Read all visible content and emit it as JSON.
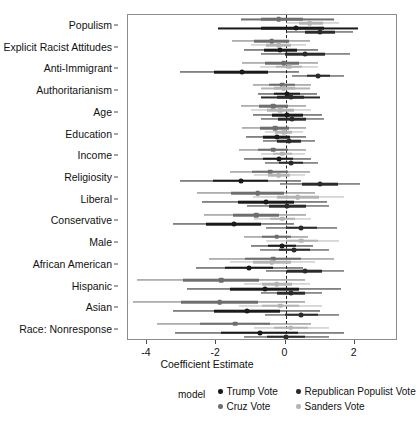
{
  "chart_data": {
    "type": "scatter",
    "title": "",
    "xlabel": "Coefficient Estimate",
    "ylabel": "",
    "xlim": [
      -4.55,
      3.25
    ],
    "xticks": [
      -4,
      -2,
      0,
      2
    ],
    "xticklabels": [
      "-4",
      "-2",
      "0",
      "2"
    ],
    "grid": false,
    "reference_line": 0,
    "legend_position": "bottom",
    "legend_title": "model",
    "categories": [
      "Populism",
      "Explicit Racist Attitudes",
      "Anti-Immigrant",
      "Authoritarianism",
      "Age",
      "Education",
      "Income",
      "Religiosity",
      "Liberal",
      "Conservative",
      "Male",
      "African American",
      "Hispanic",
      "Asian",
      "Race: Nonresponse"
    ],
    "series": [
      {
        "name": "Trump Vote",
        "color": "#1a1a1a",
        "marker": "circle",
        "estimates": [
          0.3,
          -0.15,
          -1.25,
          0.05,
          0.05,
          -0.25,
          -0.2,
          -1.3,
          -0.55,
          -1.5,
          -0.1,
          -1.05,
          -0.6,
          -1.1,
          -0.75
        ],
        "ci_low": [
          -1.95,
          -1.2,
          -3.05,
          -0.8,
          -0.95,
          -1.15,
          -1.2,
          -3.05,
          -2.4,
          -3.25,
          -1.0,
          -2.6,
          -2.85,
          -3.25,
          -3.2
        ],
        "ci_high": [
          2.1,
          0.95,
          0.4,
          0.9,
          1.05,
          0.6,
          0.75,
          0.45,
          1.2,
          0.25,
          0.8,
          0.5,
          1.6,
          1.0,
          1.7
        ]
      },
      {
        "name": "Republican Populist Vote",
        "color": "#2b2b2b",
        "marker": "circle",
        "estimates": [
          1.0,
          0.55,
          0.95,
          0.15,
          0.2,
          0.1,
          0.15,
          1.0,
          0.05,
          0.45,
          0.25,
          0.55,
          0.15,
          0.45,
          0.0
        ],
        "ci_low": [
          0.05,
          -0.7,
          0.2,
          -0.7,
          -0.7,
          -0.65,
          -0.6,
          -0.15,
          -1.1,
          -0.55,
          -0.75,
          -0.55,
          -0.7,
          -0.6,
          -1.2
        ],
        "ci_high": [
          1.95,
          1.85,
          1.7,
          1.0,
          1.1,
          0.85,
          0.95,
          2.15,
          1.25,
          1.5,
          1.25,
          1.7,
          1.05,
          1.55,
          1.25
        ]
      },
      {
        "name": "Cruz Vote",
        "color": "#6e6e6e",
        "marker": "square",
        "estimates": [
          -0.2,
          -0.4,
          -0.05,
          -0.1,
          -0.35,
          -0.3,
          -0.35,
          -0.45,
          -0.8,
          -0.85,
          -0.25,
          -0.35,
          -1.85,
          -1.9,
          -1.45
        ],
        "ci_low": [
          -1.3,
          -1.55,
          -1.25,
          -0.95,
          -1.3,
          -1.25,
          -1.35,
          -1.6,
          -2.55,
          -2.35,
          -1.2,
          -2.2,
          -4.3,
          -4.4,
          -3.7
        ],
        "ci_high": [
          1.4,
          0.7,
          0.95,
          0.75,
          0.6,
          0.6,
          0.6,
          0.7,
          0.85,
          0.6,
          0.65,
          1.4,
          0.55,
          0.55,
          0.75
        ]
      },
      {
        "name": "Sanders Vote",
        "color": "#b4b4b4",
        "marker": "square",
        "estimates": [
          0.7,
          -0.2,
          0.1,
          -0.05,
          -0.15,
          -0.05,
          -0.1,
          -0.2,
          0.35,
          -0.1,
          0.45,
          -0.4,
          -0.25,
          -0.15,
          0.15
        ],
        "ci_low": [
          0.0,
          -1.0,
          -0.75,
          -0.7,
          -1.0,
          -0.6,
          -0.7,
          -0.9,
          -0.95,
          -0.9,
          -0.55,
          -1.6,
          -1.2,
          -1.35,
          -0.9
        ],
        "ci_high": [
          1.55,
          0.6,
          0.95,
          0.7,
          0.75,
          0.5,
          0.55,
          0.55,
          1.7,
          0.75,
          1.55,
          0.85,
          0.7,
          1.05,
          1.25
        ]
      }
    ]
  },
  "axis": {
    "x_title": "Coefficient Estimate"
  },
  "legend": {
    "title": "model",
    "entries": [
      {
        "label": "Trump Vote",
        "color": "#1a1a1a"
      },
      {
        "label": "Republican Populist Vote",
        "color": "#2b2b2b"
      },
      {
        "label": "Cruz Vote",
        "color": "#6e6e6e"
      },
      {
        "label": "Sanders Vote",
        "color": "#b4b4b4"
      }
    ]
  }
}
